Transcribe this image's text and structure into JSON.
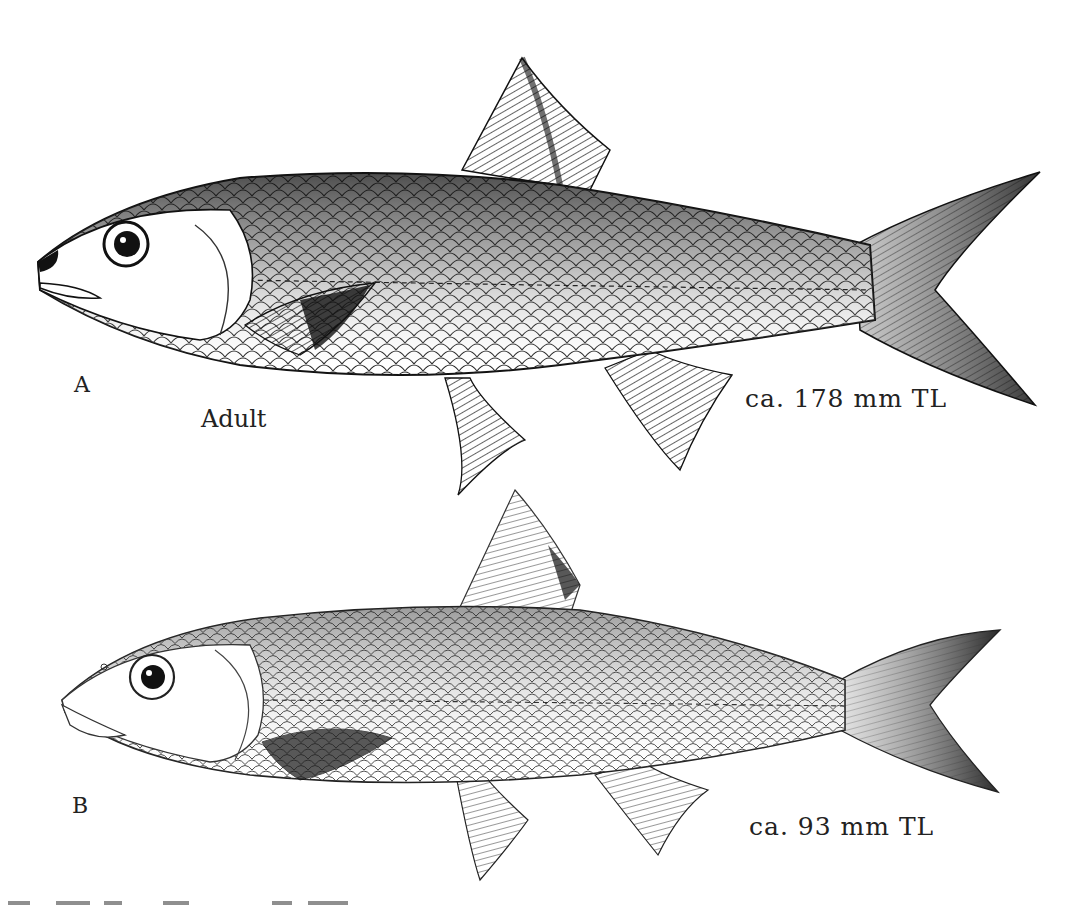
{
  "figure": {
    "panels": [
      {
        "letter": "A",
        "stage": "Adult",
        "size": "ca. 178 mm TL"
      },
      {
        "letter": "B",
        "stage": "",
        "size": "ca. 93 mm TL"
      }
    ],
    "colors": {
      "ink": "#111111",
      "paper": "#ffffff"
    }
  }
}
